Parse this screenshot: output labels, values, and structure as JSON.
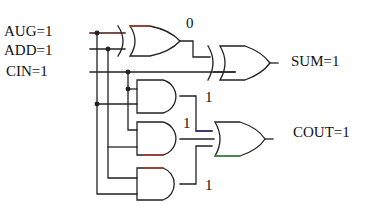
{
  "diagram": {
    "inputs": [
      {
        "name": "AUG",
        "value": "1",
        "label": "AUG=1"
      },
      {
        "name": "ADD",
        "value": "1",
        "label": "ADD=1"
      },
      {
        "name": "CIN",
        "value": "1",
        "label": "CIN=1"
      }
    ],
    "outputs": [
      {
        "name": "SUM",
        "value": "1",
        "label": "SUM=1"
      },
      {
        "name": "COUT",
        "value": "1",
        "label": "COUT=1"
      }
    ],
    "intermediate_values": {
      "xor1_out": "0",
      "and1_out": "1",
      "and2_out": "1",
      "and3_out": "1"
    },
    "gates": [
      {
        "id": "xor1",
        "type": "XOR",
        "inputs": [
          "AUG",
          "ADD"
        ]
      },
      {
        "id": "xor2",
        "type": "XOR",
        "inputs": [
          "xor1_out",
          "CIN"
        ]
      },
      {
        "id": "and1",
        "type": "AND",
        "inputs": [
          "CIN",
          "AUG"
        ]
      },
      {
        "id": "and2",
        "type": "AND",
        "inputs": [
          "CIN",
          "ADD"
        ]
      },
      {
        "id": "and3",
        "type": "AND",
        "inputs": [
          "ADD",
          "AUG"
        ]
      },
      {
        "id": "or1",
        "type": "OR",
        "inputs": [
          "and1_out",
          "and2_out",
          "and3_out"
        ]
      }
    ],
    "colors": {
      "wire": "#222222",
      "highlight_red": "#c0392b",
      "highlight_blue": "#3a2a8a",
      "highlight_green": "#3aa84a"
    }
  }
}
